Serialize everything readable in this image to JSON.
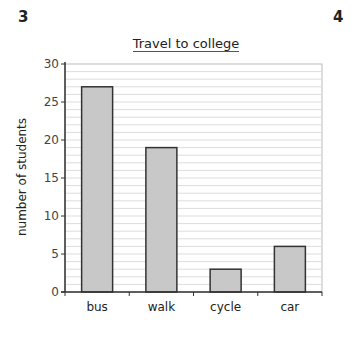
{
  "page": {
    "question_left": "3",
    "question_right": "4"
  },
  "chart_data": {
    "type": "bar",
    "title": "Travel to college",
    "xlabel": "",
    "ylabel": "number of students",
    "categories": [
      "bus",
      "walk",
      "cycle",
      "car"
    ],
    "values": [
      27,
      19,
      3,
      6
    ],
    "ylim": [
      0,
      30
    ],
    "yticks": [
      0,
      5,
      10,
      15,
      20,
      25,
      30
    ],
    "grid": {
      "on": true,
      "minor_step": 1
    },
    "legend": null,
    "colors": {
      "bar_fill": "#c8c8c8",
      "bar_stroke": "#333333",
      "grid": "#dddddd",
      "axis": "#333333"
    }
  }
}
